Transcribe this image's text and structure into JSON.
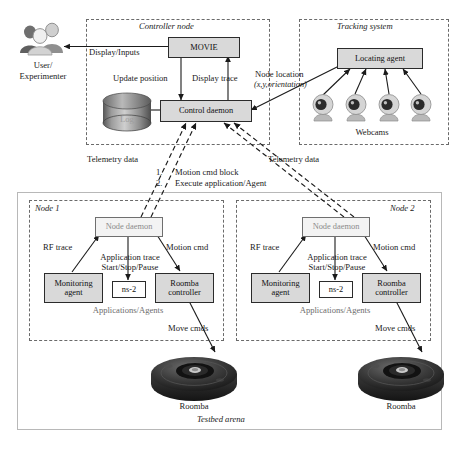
{
  "figure": {
    "type": "system-architecture-diagram",
    "caption_partial": ""
  },
  "actors": {
    "user": {
      "line1": "User/",
      "line2": "Experimenter",
      "icon": "people-group-icon"
    }
  },
  "containers": {
    "controller_node": {
      "title": "Controller node"
    },
    "tracking_system": {
      "title": "Tracking system"
    },
    "testbed_arena": {
      "title": "Testbed arena"
    },
    "node1": {
      "title": "Node 1"
    },
    "node2": {
      "title": "Node 2"
    }
  },
  "blocks": {
    "movie": "MOVIE",
    "control_daemon": "Control daemon",
    "log": "Log",
    "locating_agent": "Locating agent",
    "webcams_label": "Webcams",
    "node_daemon": "Node daemon",
    "monitoring_agent_l1": "Monitoring",
    "monitoring_agent_l2": "agent",
    "ns2": "ns-2",
    "roomba_controller_l1": "Roomba",
    "roomba_controller_l2": "controller",
    "applications_agents": "Applications/Agents",
    "roomba": "Roomba"
  },
  "edge_labels": {
    "display_inputs": "Display/Inputs",
    "update_position": "Update position",
    "display_trace": "Display trace",
    "node_location_l1": "Node location",
    "node_location_l2": "(x,y,orientation)",
    "telemetry_left": "Telemetry data",
    "telemetry_right": "Telemetry data",
    "rf_trace": "RF trace",
    "motion_cmd": "Motion cmd",
    "application_trace": "Application trace",
    "start_stop_pause": "Start/Stop/Pause",
    "move_cmds": "Move cmds"
  },
  "numbered_notes": [
    {
      "num": "1.",
      "text": "Motion cmd block"
    },
    {
      "num": "2.",
      "text": "Execute application/Agent"
    }
  ],
  "colors": {
    "box_fill": "#d9d9d9",
    "box_stroke": "#2b2b2b",
    "dashed_stroke": "#6a6a6a",
    "arrow": "#1a1a1a",
    "faint_text": "#8b8b8b",
    "roomba_body": "#2d2d2d"
  }
}
